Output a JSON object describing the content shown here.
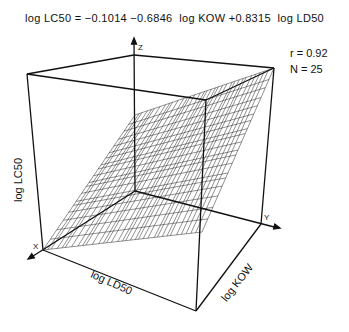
{
  "chart_data": {
    "type": "surface3d",
    "title": "log LC50 = −0.1014 −0.6846  log KOW +0.8315  log LD50",
    "equation": {
      "response": "log LC50",
      "intercept": -0.1014,
      "coefficients": [
        {
          "term": "log KOW",
          "value": -0.6846
        },
        {
          "term": "log LD50",
          "value": 0.8315
        }
      ]
    },
    "statistics": {
      "r_label": "r = 0.92",
      "n_label": "N = 25",
      "r": 0.92,
      "N": 25
    },
    "axes": {
      "x": {
        "letter": "X",
        "label": "log  LD50"
      },
      "y": {
        "letter": "Y",
        "label": "log  KOW"
      },
      "z": {
        "letter": "Z",
        "label": "log  LC50"
      }
    },
    "grid": false,
    "surface": "fitted regression plane drawn as wire mesh"
  }
}
